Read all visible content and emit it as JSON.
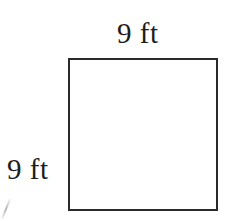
{
  "figure": {
    "type": "square",
    "shape_name": "square-outline",
    "stroke_color": "#2b2b2b",
    "fill_color": "#ffffff",
    "background_color": "#ffffff",
    "labels": {
      "top": "9 ft",
      "left": "9 ft"
    },
    "measurements": {
      "side_length_value": "9",
      "side_length_unit": "ft",
      "width_label": "9 ft",
      "height_label": "9 ft"
    },
    "artifact": {
      "name": "scan-artifact-mark",
      "visible": true
    }
  }
}
